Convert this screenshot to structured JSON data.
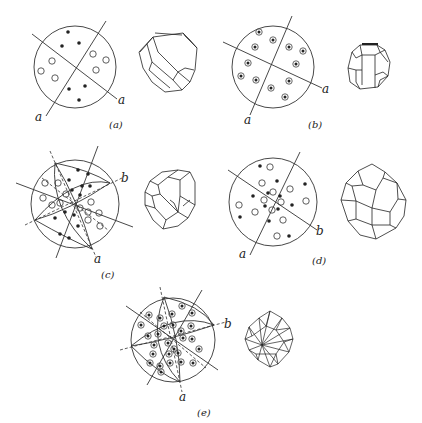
{
  "figure": {
    "ink_color": "#222222",
    "background": "#ffffff",
    "panels": [
      {
        "id": "a",
        "caption": "(a)",
        "axis_labels": [
          "a",
          "a"
        ],
        "pole_types": {
          "filled_dots": 6,
          "open_circles": 6,
          "dotted_circles": 0
        },
        "symmetry_lines": 2,
        "great_circles": false,
        "crystal_habit": "irregular polyhedron with elongated facets"
      },
      {
        "id": "b",
        "caption": "(b)",
        "axis_labels": [
          "a",
          "a"
        ],
        "pole_types": {
          "filled_dots": 0,
          "open_circles": 0,
          "dotted_circles": 12
        },
        "symmetry_lines": 2,
        "great_circles": false,
        "crystal_habit": "rounded prismatic polyhedron"
      },
      {
        "id": "c",
        "caption": "(c)",
        "axis_labels": [
          "b",
          "a"
        ],
        "pole_types": {
          "filled_dots": 12,
          "open_circles": 12,
          "dotted_circles": 0
        },
        "symmetry_lines": 3,
        "dashed_lines": 3,
        "great_circles": true,
        "crystal_habit": "tetrahedral-like rounded polyhedron"
      },
      {
        "id": "d",
        "caption": "(d)",
        "axis_labels": [
          "a",
          "b"
        ],
        "pole_types": {
          "filled_dots": 12,
          "open_circles": 12,
          "dotted_circles": 0
        },
        "symmetry_lines": 2,
        "great_circles": false,
        "crystal_habit": "pentagonal dodecahedron-like polyhedron"
      },
      {
        "id": "e",
        "caption": "(e)",
        "axis_labels": [
          "b",
          "a"
        ],
        "pole_types": {
          "filled_dots": 0,
          "open_circles": 0,
          "dotted_circles": 24
        },
        "symmetry_lines": 3,
        "dashed_lines": 3,
        "great_circles": true,
        "crystal_habit": "hexoctahedral polyhedron with radiating faces"
      }
    ]
  }
}
